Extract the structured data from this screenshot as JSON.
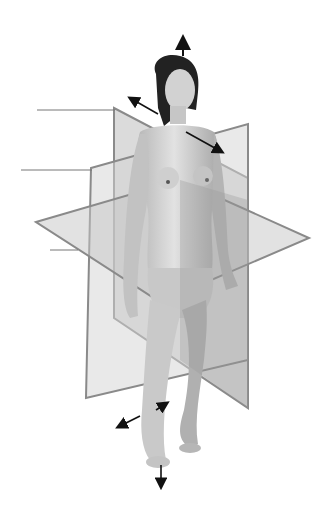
{
  "figure": {
    "background": "#ffffff",
    "colors": {
      "plane_fill": "#c8c8c8",
      "plane_fill_dark": "#a9a9a9",
      "plane_edge": "#8a8a8a",
      "skin": "#cfcfcf",
      "skin_shade": "#b3b3b3",
      "hair": "#222222",
      "arrow": "#111111",
      "leader": "#777777"
    },
    "planes": [
      {
        "id": "sagittal",
        "label": ""
      },
      {
        "id": "frontal",
        "label": ""
      },
      {
        "id": "transverse",
        "label": ""
      }
    ],
    "leader_lines": [
      {
        "id": "leader-1",
        "label": "",
        "x1": 37,
        "y1": 110,
        "x2": 115,
        "y2": 110
      },
      {
        "id": "leader-2",
        "label": "",
        "x1": 21,
        "y1": 170,
        "x2": 92,
        "y2": 170
      },
      {
        "id": "leader-3",
        "label": "",
        "x1": 50,
        "y1": 250,
        "x2": 78,
        "y2": 250
      }
    ],
    "arrows": [
      {
        "id": "superior",
        "direction": "up"
      },
      {
        "id": "inferior",
        "direction": "down"
      },
      {
        "id": "posterior-anterior-upper",
        "direction": "diagonal"
      },
      {
        "id": "lateral-lower",
        "direction": "diagonal"
      }
    ]
  }
}
